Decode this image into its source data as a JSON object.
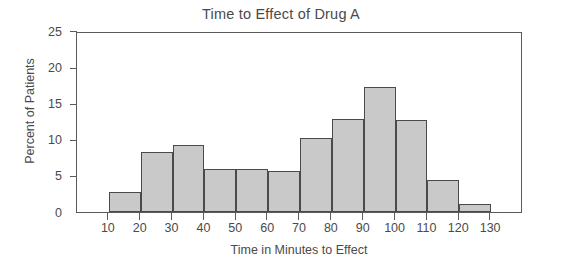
{
  "chart_data": {
    "type": "bar",
    "title": "Time to Effect of Drug A",
    "xlabel": "Time in Minutes to Effect",
    "ylabel": "Percent of Patients",
    "grid": false,
    "legend": "none",
    "bin_edges": [
      10,
      20,
      30,
      40,
      50,
      60,
      70,
      80,
      90,
      100,
      110,
      120,
      130
    ],
    "categories": [
      "10-20",
      "20-30",
      "30-40",
      "40-50",
      "50-60",
      "60-70",
      "70-80",
      "80-90",
      "90-100",
      "100-110",
      "110-120",
      "120-130"
    ],
    "values": [
      2.8,
      8.3,
      9.3,
      5.9,
      5.9,
      5.7,
      10.2,
      12.8,
      17.3,
      12.7,
      4.4,
      1.1
    ],
    "xlim": [
      0,
      140
    ],
    "ylim": [
      0,
      25
    ],
    "xticks": [
      10,
      20,
      30,
      40,
      50,
      60,
      70,
      80,
      90,
      100,
      110,
      120,
      130
    ],
    "xtick_labels": [
      "10",
      "20",
      "30",
      "40",
      "50",
      "60",
      "70",
      "80",
      "90",
      "100",
      "110",
      "120",
      "130"
    ],
    "yticks": [
      0,
      5,
      10,
      15,
      20,
      25
    ],
    "ytick_labels": [
      "0",
      "5",
      "10",
      "15",
      "20",
      "25"
    ],
    "bar_fill_color": "#c9c9c9",
    "bar_edge_color": "#4a4a4a",
    "axis_color": "#5a5a5a",
    "text_color": "#4a4a4a",
    "background_color": "#ffffff"
  }
}
